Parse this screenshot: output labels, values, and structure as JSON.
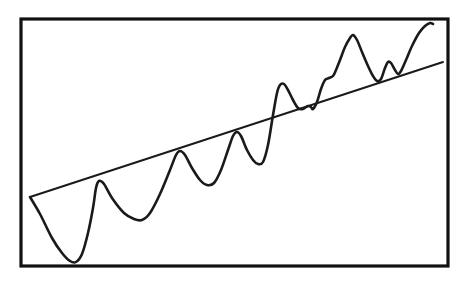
{
  "figure": {
    "background_color": "#ffffff",
    "ink_color": "#1a1a1a",
    "frame_color": "#111111",
    "width": 472,
    "height": 281
  },
  "frame": {
    "name": "plot-border",
    "x": 21,
    "y": 19,
    "width": 427,
    "height": 247,
    "stroke_width": 3.2
  },
  "chart_data": {
    "type": "line",
    "subtitle": "",
    "xlabel": "",
    "ylabel": "",
    "xlim": [
      21,
      448
    ],
    "ylim": [
      19,
      266
    ],
    "grid": false,
    "legend": "none",
    "axis_ticks": "none",
    "tick_labels": [],
    "annotations": [],
    "series": [
      {
        "name": "oscillating-curve",
        "style": "hand-drawn wave, increasing amplitude and frequency, upward drift",
        "color": "#1a1a1a",
        "stroke_width": 2.6,
        "points": [
          [
            30,
            197
          ],
          [
            40,
            214
          ],
          [
            52,
            238
          ],
          [
            62,
            253
          ],
          [
            70,
            261
          ],
          [
            76,
            262
          ],
          [
            82,
            254
          ],
          [
            88,
            233
          ],
          [
            93,
            208
          ],
          [
            96,
            188
          ],
          [
            99,
            181
          ],
          [
            104,
            184
          ],
          [
            112,
            198
          ],
          [
            124,
            213
          ],
          [
            134,
            219
          ],
          [
            142,
            220
          ],
          [
            150,
            213
          ],
          [
            160,
            194
          ],
          [
            170,
            170
          ],
          [
            176,
            155
          ],
          [
            180,
            151
          ],
          [
            185,
            155
          ],
          [
            192,
            168
          ],
          [
            200,
            180
          ],
          [
            207,
            185
          ],
          [
            214,
            183
          ],
          [
            221,
            170
          ],
          [
            228,
            150
          ],
          [
            233,
            136
          ],
          [
            237,
            132
          ],
          [
            241,
            136
          ],
          [
            247,
            150
          ],
          [
            253,
            160
          ],
          [
            258,
            164
          ],
          [
            263,
            162
          ],
          [
            268,
            145
          ],
          [
            273,
            115
          ],
          [
            277,
            93
          ],
          [
            280,
            85
          ],
          [
            284,
            84
          ],
          [
            288,
            90
          ],
          [
            293,
            100
          ],
          [
            298,
            108
          ],
          [
            303,
            109
          ],
          [
            308,
            106
          ],
          [
            311,
            107
          ],
          [
            313,
            109
          ],
          [
            317,
            102
          ],
          [
            321,
            89
          ],
          [
            325,
            80
          ],
          [
            329,
            78
          ],
          [
            333,
            76
          ],
          [
            336,
            70
          ],
          [
            340,
            60
          ],
          [
            345,
            47
          ],
          [
            350,
            38
          ],
          [
            353,
            35
          ],
          [
            357,
            40
          ],
          [
            362,
            52
          ],
          [
            368,
            66
          ],
          [
            373,
            76
          ],
          [
            377,
            81
          ],
          [
            381,
            79
          ],
          [
            385,
            68
          ],
          [
            388,
            62
          ],
          [
            391,
            63
          ],
          [
            395,
            70
          ],
          [
            398,
            74
          ],
          [
            401,
            71
          ],
          [
            406,
            60
          ],
          [
            412,
            46
          ],
          [
            419,
            33
          ],
          [
            425,
            26
          ],
          [
            430,
            23
          ],
          [
            433,
            24
          ]
        ]
      },
      {
        "name": "trend-line",
        "style": "straight ruled line through the wave peaks",
        "color": "#1a1a1a",
        "stroke_width": 1.9,
        "points": [
          [
            30,
            197
          ],
          [
            443,
            62
          ]
        ],
        "start_point": [
          30,
          197
        ],
        "end_point": [
          443,
          62
        ],
        "direction": "upward"
      }
    ]
  },
  "caption": "Hand-drawn sketch: a sawtooth-like oscillating curve whose peaks ride along an ascending straight trend line; amplitude grows and cycles tighten toward the right."
}
